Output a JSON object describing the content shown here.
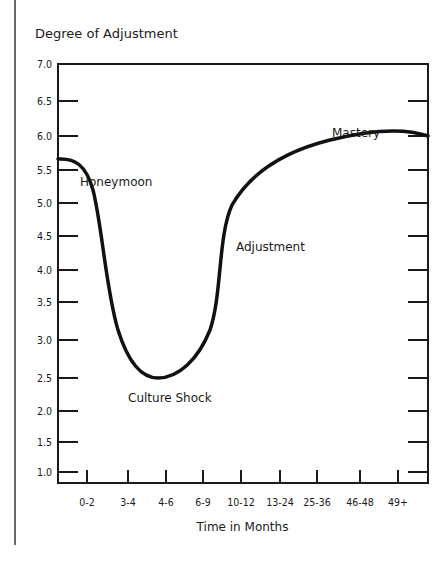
{
  "chart_data": {
    "type": "line",
    "title": "",
    "ylabel": "Degree of Adjustment",
    "xlabel": "Time in Months",
    "ylim": [
      1.0,
      7.0
    ],
    "y_ticks": [
      "7.0",
      "6.5",
      "6.0",
      "5.5",
      "5.0",
      "4.5",
      "4.0",
      "3.5",
      "3.0",
      "2.5",
      "2.0",
      "1.5",
      "1.0"
    ],
    "categories": [
      "0-2",
      "3-4",
      "4-6",
      "6-9",
      "10-12",
      "13-24",
      "25-36",
      "46-48",
      "49+"
    ],
    "series": [
      {
        "name": "Adjustment curve",
        "values": [
          5.3,
          3.0,
          2.45,
          2.9,
          5.0,
          5.7,
          6.1,
          6.35,
          6.45
        ]
      }
    ],
    "start_value": 5.65,
    "minimum": {
      "value": 2.45,
      "near": "4-6"
    },
    "annotations": [
      {
        "text": "Honeymoon",
        "near": "start",
        "y": 5.6
      },
      {
        "text": "Culture Shock",
        "near": "4-6",
        "y": 2.2
      },
      {
        "text": "Adjustment",
        "near": "10-12",
        "y": 4.3
      },
      {
        "text": "Mastery",
        "near": "25-36",
        "y": 6.2
      }
    ],
    "grid": false,
    "legend": null
  },
  "labels": {
    "ylabel": "Degree of Adjustment",
    "xlabel": "Time in Months",
    "honeymoon": "Honeymoon",
    "culture_shock": "Culture Shock",
    "adjustment": "Adjustment",
    "mastery": "Mastery"
  }
}
